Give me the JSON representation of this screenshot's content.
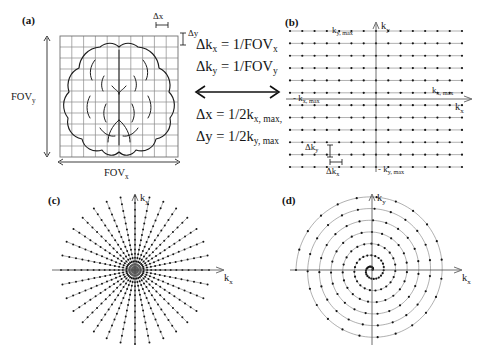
{
  "figure": {
    "background": "#ffffff",
    "ink": "#141414",
    "grid_color": "#8a8a8a",
    "traj_color": "#6e6e6e"
  },
  "panels": {
    "a": {
      "label": "(a)",
      "fov_x_label": "FOV",
      "fov_x_sub": "x",
      "fov_y_label": "FOV",
      "fov_y_sub": "y",
      "delta_x_label": "Δx",
      "delta_y_label": "Δy",
      "grid_cols": 10,
      "grid_rows": 11,
      "content": "brain-outline-on-image-grid"
    },
    "b": {
      "label": "(b)",
      "kx_axis_label": "k",
      "kx_axis_sub": "x",
      "ky_axis_label": "k",
      "ky_axis_sub": "y",
      "kx_max_label": "k",
      "kx_max_sub": "x, max",
      "neg_kx_max_label": "- k",
      "neg_kx_max_sub": "x, max",
      "ky_max_label": "k",
      "ky_max_sub": "y, max",
      "neg_ky_max_label": "- k",
      "neg_ky_max_sub": "y, max",
      "delta_kx_label": "Δk",
      "delta_kx_sub": "x",
      "delta_ky_label": "Δk",
      "delta_ky_sub": "y",
      "rows": 12,
      "dots_per_row": 15,
      "content": "cartesian-raster-k-space"
    },
    "c": {
      "label": "(c)",
      "kx_axis_label": "k",
      "kx_axis_sub": "x",
      "ky_axis_label": "k",
      "ky_axis_sub": "y",
      "spokes": 32,
      "samples_per_spoke": 16,
      "content": "radial-projection-k-space"
    },
    "d": {
      "label": "(d)",
      "kx_axis_label": "k",
      "kx_axis_sub": "x",
      "ky_axis_label": "k",
      "ky_axis_sub": "y",
      "turns": 6.5,
      "samples": 150,
      "content": "spiral-k-space"
    }
  },
  "equations": {
    "lines": [
      {
        "lhs": "Δk",
        "lhs_sub": "x",
        "rhs": " = 1/FOV",
        "rhs_sub": "x"
      },
      {
        "lhs": "Δk",
        "lhs_sub": "y",
        "rhs": " = 1/FOV",
        "rhs_sub": "y"
      },
      {
        "lhs": "Δx",
        "lhs_sub": "",
        "rhs": " = 1/2k",
        "rhs_sub": "x, max,"
      },
      {
        "lhs": "Δy",
        "lhs_sub": "",
        "rhs": " = 1/2k",
        "rhs_sub": "y, max"
      }
    ],
    "arrow": "double-headed-horizontal-arrow"
  }
}
